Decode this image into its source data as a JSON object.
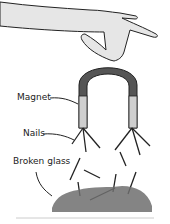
{
  "labels": {
    "magnet": "Magnet",
    "nails": "Nails",
    "broken_glass": "Broken glass"
  },
  "colors": {
    "skin": "#e6e6e6",
    "outline": "#222222",
    "magnet_dark": "#555555",
    "magnet_light": "#cfcfcf",
    "glass": "#6f6f6f",
    "rule": "#cccccc"
  }
}
